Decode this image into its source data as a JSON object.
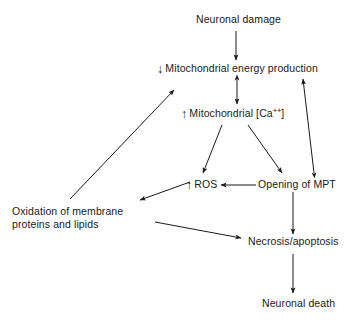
{
  "diagram": {
    "background_color": "#ffffff",
    "stroke_color": "#1a1a1a",
    "nodes": {
      "neuronal_damage": {
        "text": "Neuronal damage"
      },
      "energy_production": {
        "prefix_icon": "↓",
        "text": "Mitochondrial energy production"
      },
      "calcium": {
        "prefix_icon": "↑",
        "text_before": "Mitochondrial [Ca",
        "superscript": "++",
        "text_after": "]"
      },
      "ros": {
        "prefix_icon": "↑",
        "text": "ROS"
      },
      "mpt": {
        "text": "Opening of MPT"
      },
      "oxidation": {
        "line1": "Oxidation of membrane",
        "line2": "proteins and lipids"
      },
      "necrosis": {
        "text": "Necrosis/apoptosis"
      },
      "neuronal_death": {
        "text": "Neuronal death"
      }
    },
    "edges": [
      {
        "name": "damage-to-energy",
        "from": "neuronal_damage",
        "to": "energy_production",
        "style": "single"
      },
      {
        "name": "energy-calcium-bidirectional",
        "from": "energy_production",
        "to": "calcium",
        "style": "double"
      },
      {
        "name": "calcium-to-ros",
        "from": "calcium",
        "to": "ros",
        "style": "single"
      },
      {
        "name": "calcium-to-mpt",
        "from": "calcium",
        "to": "mpt",
        "style": "single"
      },
      {
        "name": "mpt-to-ros",
        "from": "mpt",
        "to": "ros",
        "style": "single"
      },
      {
        "name": "mpt-energy-bidirectional",
        "from": "mpt",
        "to": "energy_production",
        "style": "double"
      },
      {
        "name": "ros-to-oxidation",
        "from": "ros",
        "to": "oxidation",
        "style": "single"
      },
      {
        "name": "oxidation-to-energy",
        "from": "oxidation",
        "to": "energy_production",
        "style": "single"
      },
      {
        "name": "oxidation-to-necrosis",
        "from": "oxidation",
        "to": "necrosis",
        "style": "single"
      },
      {
        "name": "mpt-to-necrosis",
        "from": "mpt",
        "to": "necrosis",
        "style": "single"
      },
      {
        "name": "necrosis-to-death",
        "from": "necrosis",
        "to": "neuronal_death",
        "style": "single"
      }
    ]
  }
}
